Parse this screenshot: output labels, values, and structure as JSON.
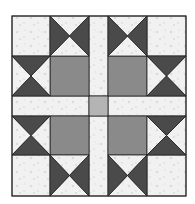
{
  "image": {
    "subject": "quilt-block",
    "background": "#ffffff"
  },
  "colors": {
    "light_fabric": "#f1f1f1",
    "light_fabric_mottle": "#dcdcdc",
    "dark_fabric": "#4a4a4a",
    "medium_fabric": "#8a8a8a",
    "center_square": "#b4b4b4",
    "seam_line": "#222222"
  },
  "grid": {
    "columns": [
      12,
      50,
      89,
      108,
      147,
      186
    ],
    "rows": [
      16,
      56,
      96,
      116,
      155,
      196
    ]
  },
  "patches": {
    "corner_squares": 4,
    "hourglass_units": 8,
    "medium_squares": 4,
    "sashing_strips": 4,
    "center_square": 1
  }
}
